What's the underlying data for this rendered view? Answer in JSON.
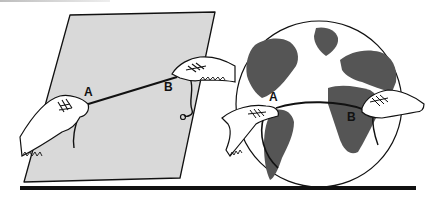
{
  "figure": {
    "left_panel": {
      "subject": "flat sheet",
      "label_a": "A",
      "label_b": "B"
    },
    "right_panel": {
      "subject": "globe",
      "label_a": "A",
      "label_b": "B"
    }
  },
  "colors": {
    "sheet_fill": "#d9d9d9",
    "land_fill": "#555555",
    "ink": "#111111",
    "background": "#ffffff"
  }
}
